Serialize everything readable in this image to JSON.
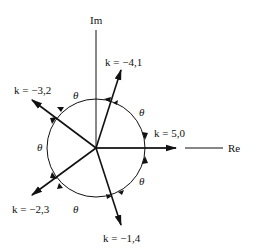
{
  "axes": {
    "imag_label": "Im",
    "real_label": "Re"
  },
  "vectors": [
    {
      "label": "k = −4,1",
      "angle_deg": 72
    },
    {
      "label": "k = −3,2",
      "angle_deg": 144
    },
    {
      "label": "k = 5,0",
      "angle_deg": 0
    },
    {
      "label": "k = −2,3",
      "angle_deg": 216
    },
    {
      "label": "k = −1,4",
      "angle_deg": 288
    }
  ],
  "angle_symbol": "θ",
  "colors": {
    "stroke": "#111111",
    "background": "#ffffff"
  }
}
